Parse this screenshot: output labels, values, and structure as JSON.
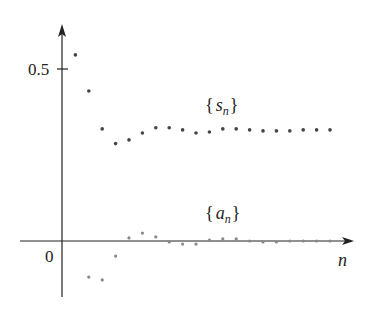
{
  "chart_data": {
    "type": "scatter",
    "title": "",
    "xlabel": "n",
    "ylabel": "",
    "y_ticks": [
      {
        "value": 0,
        "label": "0"
      },
      {
        "value": 0.5,
        "label": "0.5"
      }
    ],
    "grid": false,
    "legend": "inline annotations",
    "x": [
      1,
      2,
      3,
      4,
      5,
      6,
      7,
      8,
      9,
      10,
      11,
      12,
      13,
      14,
      15,
      16,
      17,
      18,
      19,
      20
    ],
    "series": [
      {
        "name": "{s_n}",
        "label_main": "s",
        "label_sub": "n",
        "color": "#444444",
        "values": [
          0.541,
          0.436,
          0.326,
          0.283,
          0.294,
          0.314,
          0.329,
          0.329,
          0.323,
          0.314,
          0.317,
          0.326,
          0.326,
          0.323,
          0.32,
          0.32,
          0.32,
          0.323,
          0.323,
          0.323
        ]
      },
      {
        "name": "{a_n}",
        "label_main": "a",
        "label_sub": "n",
        "color": "#888888",
        "values": [
          null,
          -0.105,
          -0.113,
          -0.044,
          0.009,
          0.023,
          0.012,
          -0.003,
          -0.009,
          -0.009,
          0.003,
          0.006,
          0.006,
          0.0,
          -0.003,
          -0.003,
          0.0,
          0.0,
          0.0,
          0.0
        ]
      }
    ],
    "ylim": [
      -0.16,
      0.63
    ]
  },
  "labels": {
    "y_tick_half": "0.5",
    "origin": "0",
    "x_axis": "n",
    "s_open": "{",
    "s_main": "s",
    "s_sub": "n",
    "s_close": "}",
    "a_open": "{",
    "a_main": "a",
    "a_sub": "n",
    "a_close": "}"
  }
}
